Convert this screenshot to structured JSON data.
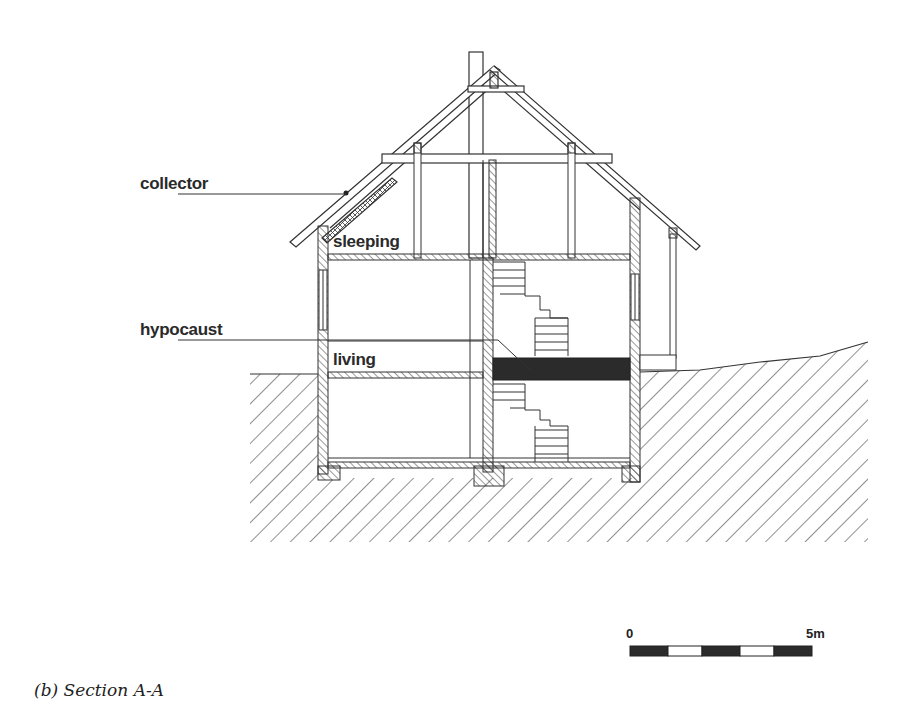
{
  "figure": {
    "caption": "(b) Section A-A",
    "type": "architectural section drawing of a two-storey house with basement"
  },
  "labels": {
    "collector": "collector",
    "hypocaust": "hypocaust",
    "sleeping": "sleeping",
    "living": "living"
  },
  "scale_bar": {
    "start_label": "0",
    "end_label": "5m",
    "segments": [
      "black",
      "white",
      "black",
      "white",
      "black"
    ]
  },
  "colors": {
    "line": "#333333",
    "fill_dark": "#2b2b2b",
    "background": "#ffffff"
  }
}
